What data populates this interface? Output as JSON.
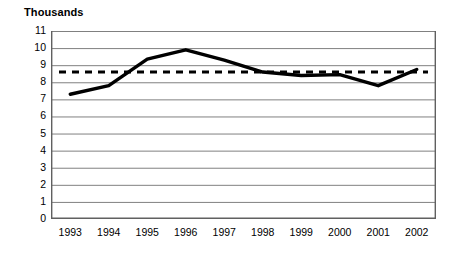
{
  "chart_data": {
    "type": "line",
    "title": "Thousands",
    "xlabel": "",
    "ylabel": "",
    "categories": [
      "1993",
      "1994",
      "1995",
      "1996",
      "1997",
      "1998",
      "1999",
      "2000",
      "2001",
      "2002"
    ],
    "series": [
      {
        "name": "value",
        "style": "solid",
        "color": "#000000",
        "values": [
          7.3,
          7.8,
          9.35,
          9.9,
          9.3,
          8.6,
          8.4,
          8.45,
          7.8,
          8.75
        ]
      },
      {
        "name": "reference",
        "style": "dashed",
        "color": "#000000",
        "values": [
          8.6,
          8.6,
          8.6,
          8.6,
          8.6,
          8.6,
          8.6,
          8.6,
          8.6,
          8.6
        ]
      }
    ],
    "ylim": [
      0,
      11
    ],
    "ytick_labels": [
      "11",
      "10",
      "9",
      "8",
      "7",
      "6",
      "5",
      "4",
      "3",
      "2",
      "1",
      "0"
    ],
    "ytick_values": [
      11,
      10,
      9,
      8,
      7,
      6,
      5,
      4,
      3,
      2,
      1,
      0
    ],
    "grid": true,
    "grid_color": "#808080",
    "axis_color": "#606060",
    "legend": "none",
    "plot_background": "#ffffff"
  }
}
